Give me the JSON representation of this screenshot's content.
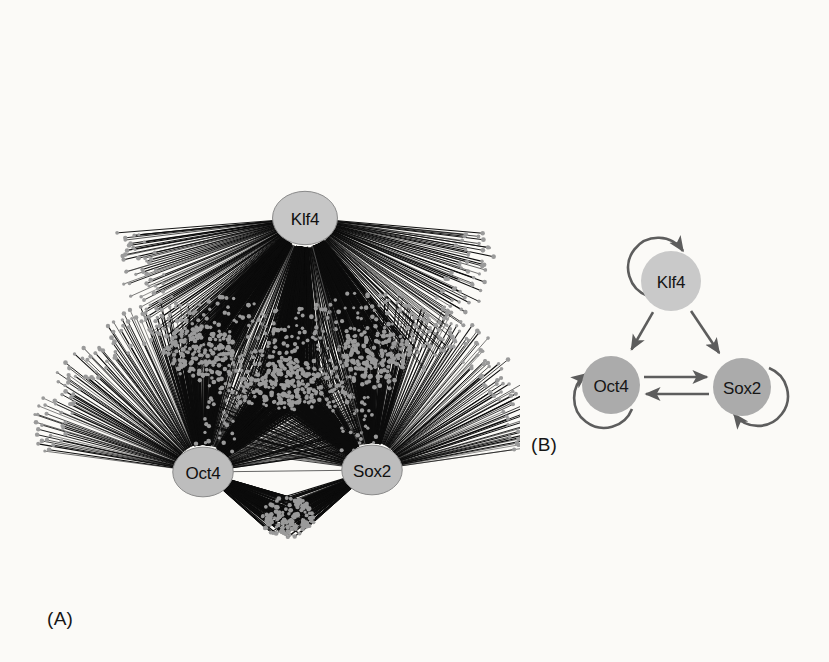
{
  "figure": {
    "background_color": "#fbfaf7",
    "width": 829,
    "height": 662
  },
  "panels": [
    {
      "id": "A",
      "caption": "(A)",
      "type": "hairball-network",
      "description": "Large-scale transcription factor binding network with three labelled hub nodes and thousands of radiating target-gene edges",
      "edge_color": "#0c0c0c",
      "target_node_color": "#9a9a9a",
      "hub_stroke_color": "#545454",
      "nodes": [
        {
          "label": "Klf4",
          "cx": 305,
          "cy": 218,
          "r": 29,
          "fill": "#c6c6c6",
          "stroke": "#8a8a8a"
        },
        {
          "label": "Oct4",
          "cx": 203,
          "cy": 472,
          "r": 27,
          "fill": "#bdbdbd",
          "stroke": "#8a8a8a"
        },
        {
          "label": "Sox2",
          "cx": 372,
          "cy": 470,
          "r": 27,
          "fill": "#bdbdbd",
          "stroke": "#8a8a8a"
        }
      ],
      "fans": [
        {
          "owner": "Klf4",
          "name": "klf4-exclusive-targets",
          "cx": 305,
          "cy": 218,
          "a0": 185,
          "a1": 355,
          "rin": 30,
          "rout": 190,
          "count": 300
        },
        {
          "owner": "Oct4",
          "name": "oct4-exclusive-targets",
          "cx": 203,
          "cy": 472,
          "a0": 8,
          "a1": 172,
          "rin": 28,
          "rout": 175,
          "count": 230
        },
        {
          "owner": "Sox2",
          "name": "sox2-exclusive-targets",
          "cx": 372,
          "cy": 470,
          "a0": 8,
          "a1": 172,
          "rin": 28,
          "rout": 175,
          "count": 230
        }
      ],
      "shared_clusters": [
        {
          "name": "klf4-oct4-shared-targets",
          "cx": 200,
          "cy": 352,
          "rx": 37,
          "ry": 26,
          "count": 150,
          "sources": [
            "Klf4",
            "Oct4"
          ]
        },
        {
          "name": "klf4-sox2-shared-targets",
          "cx": 374,
          "cy": 352,
          "rx": 37,
          "ry": 26,
          "count": 150,
          "sources": [
            "Klf4",
            "Sox2"
          ]
        },
        {
          "name": "klf4-oct4-sox2-shared-targets",
          "cx": 289,
          "cy": 384,
          "rx": 34,
          "ry": 25,
          "count": 150,
          "sources": [
            "Klf4",
            "Oct4",
            "Sox2"
          ]
        },
        {
          "name": "oct4-sox2-shared-targets",
          "cx": 288,
          "cy": 518,
          "rx": 27,
          "ry": 21,
          "count": 120,
          "sources": [
            "Oct4",
            "Sox2"
          ]
        }
      ],
      "self_loops": [
        {
          "name": "klf4-self-loop",
          "cx": 305,
          "cy": 218,
          "r": 27
        },
        {
          "name": "oct4-self-loop",
          "cx": 203,
          "cy": 472,
          "r": 25
        },
        {
          "name": "sox2-self-loop",
          "cx": 372,
          "cy": 470,
          "r": 25
        }
      ],
      "hub_edges": [
        {
          "name": "edge-oct4-sox2",
          "from": "Oct4",
          "to": "Sox2"
        },
        {
          "name": "edge-klf4-oct4",
          "from": "Klf4",
          "to": "Oct4"
        },
        {
          "name": "edge-klf4-sox2",
          "from": "Klf4",
          "to": "Sox2"
        }
      ]
    },
    {
      "id": "B",
      "caption": "(B)",
      "type": "regulatory-circuit-diagram",
      "description": "Simplified autoregulatory circuit: Klf4 activates Oct4 and Sox2; Oct4 and Sox2 cross-activate each other; all three autoregulate",
      "arrow_color": "#5d5d5d",
      "nodes": [
        {
          "label": "Klf4",
          "cx": 671,
          "cy": 281,
          "r": 30,
          "fill": "#c9c9c9"
        },
        {
          "label": "Oct4",
          "cx": 611,
          "cy": 385,
          "r": 29,
          "fill": "#ababab"
        },
        {
          "label": "Sox2",
          "cx": 742,
          "cy": 387,
          "r": 29,
          "fill": "#ababab"
        }
      ],
      "edges": [
        {
          "name": "arrow-klf4-to-oct4",
          "from": "Klf4",
          "to": "Oct4",
          "kind": "activation"
        },
        {
          "name": "arrow-klf4-to-sox2",
          "from": "Klf4",
          "to": "Sox2",
          "kind": "activation"
        },
        {
          "name": "arrow-oct4-to-sox2",
          "from": "Oct4",
          "to": "Sox2",
          "kind": "activation"
        },
        {
          "name": "arrow-sox2-to-oct4",
          "from": "Sox2",
          "to": "Oct4",
          "kind": "activation"
        },
        {
          "name": "arrow-klf4-self",
          "from": "Klf4",
          "to": "Klf4",
          "kind": "autoregulation"
        },
        {
          "name": "arrow-oct4-self",
          "from": "Oct4",
          "to": "Oct4",
          "kind": "autoregulation"
        },
        {
          "name": "arrow-sox2-self",
          "from": "Sox2",
          "to": "Sox2",
          "kind": "autoregulation"
        }
      ]
    }
  ]
}
